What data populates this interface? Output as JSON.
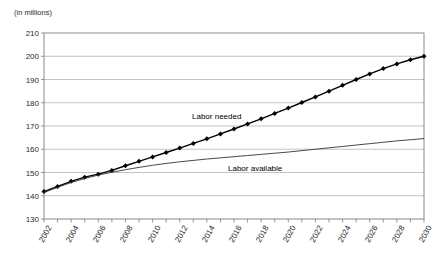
{
  "chart_data": {
    "type": "line",
    "title": "",
    "subtitle": "",
    "xlabel": "",
    "ylabel": "(in millions)",
    "unit_label": "(in millions)",
    "ylim": [
      130,
      210
    ],
    "yticks": [
      130,
      140,
      150,
      160,
      170,
      180,
      190,
      200,
      210
    ],
    "xlim": [
      2002,
      2030
    ],
    "xticks": [
      2002,
      2003,
      2004,
      2005,
      2006,
      2007,
      2008,
      2009,
      2010,
      2011,
      2012,
      2013,
      2014,
      2015,
      2016,
      2017,
      2018,
      2019,
      2020,
      2021,
      2022,
      2023,
      2024,
      2025,
      2026,
      2027,
      2028,
      2029,
      2030
    ],
    "xtick_labels": [
      "2002",
      "2004",
      "2006",
      "2008",
      "2010",
      "2012",
      "2014",
      "2016",
      "2018",
      "2020",
      "2022",
      "2024",
      "2026",
      "2028",
      "2030"
    ],
    "xtick_label_years": [
      2002,
      2004,
      2006,
      2008,
      2010,
      2012,
      2014,
      2016,
      2018,
      2020,
      2022,
      2024,
      2026,
      2028,
      2030
    ],
    "grid": "horizontal",
    "legend_position": "inline-annotations",
    "x": [
      2002,
      2003,
      2004,
      2005,
      2006,
      2007,
      2008,
      2009,
      2010,
      2011,
      2012,
      2013,
      2014,
      2015,
      2016,
      2017,
      2018,
      2019,
      2020,
      2021,
      2022,
      2023,
      2024,
      2025,
      2026,
      2027,
      2028,
      2029,
      2030
    ],
    "series": [
      {
        "name": "Labor needed",
        "marker": "diamond",
        "color": "#000000",
        "line_width": 1.4,
        "values": [
          141.8,
          144.0,
          146.2,
          148.0,
          149.3,
          150.9,
          152.9,
          154.8,
          156.7,
          158.6,
          160.5,
          162.5,
          164.5,
          166.6,
          168.7,
          170.9,
          173.1,
          175.4,
          177.7,
          180.1,
          182.5,
          185.0,
          187.5,
          190.0,
          192.4,
          194.7,
          196.7,
          198.5,
          200.0
        ]
      },
      {
        "name": "Labor available",
        "marker": "none",
        "color": "#333333",
        "line_width": 0.9,
        "values": [
          141.4,
          143.6,
          145.7,
          147.4,
          148.9,
          150.1,
          151.2,
          152.2,
          153.1,
          153.9,
          154.6,
          155.2,
          155.8,
          156.3,
          156.8,
          157.3,
          157.8,
          158.3,
          158.8,
          159.4,
          160.0,
          160.6,
          161.2,
          161.8,
          162.4,
          163.0,
          163.6,
          164.1,
          164.6
        ]
      }
    ],
    "annotations": [
      {
        "text": "Labor needed",
        "x_px": 192,
        "y_px": 112
      },
      {
        "text": "Labor available",
        "x_px": 228,
        "y_px": 164
      }
    ],
    "colors": {
      "grid": "#9a9a9a",
      "frame": "#6e6e6e",
      "text": "#2b2b2b",
      "background": "#ffffff"
    }
  }
}
